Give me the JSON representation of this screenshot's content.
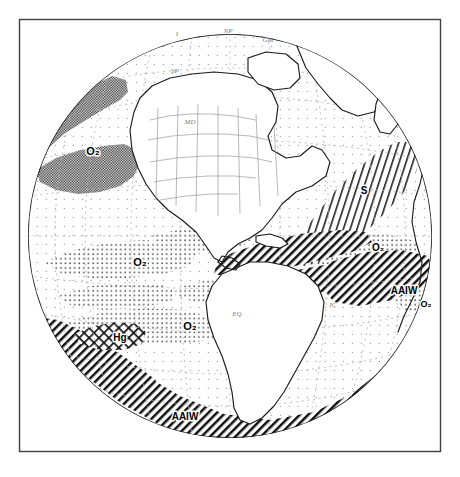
{
  "figure": {
    "type": "orthographic-globe-map",
    "title_visible": "",
    "frame": {
      "x": 19,
      "y": 19,
      "width": 422,
      "height": 433,
      "stroke": "#3a3a3a"
    },
    "globe": {
      "center_x": 230,
      "center_y": 236,
      "radius": 202,
      "stroke": "#222222"
    },
    "background_color": "#ffffff",
    "ink_color": "#000000"
  },
  "map_labels": {
    "o2_north_pacific": "O₂",
    "o2_mid_pacific": "O₂",
    "o2_east_pacific": "O₂",
    "o2_equatorial_pacific": "O₂",
    "o2_south_atlantic": "O₂",
    "o2_southeast_atlantic": "O₂",
    "aaiw_south_pacific": "AAIW",
    "aaiw_south_atlantic": "AAIW",
    "aaiw_southeast": "AAIW",
    "s_north_atlantic": "S",
    "hg_south_pacific": "Hg"
  },
  "faint_geographic_labels": [
    {
      "name": "arctic-label-i",
      "text": "I",
      "x": 177,
      "y": 36
    },
    {
      "name": "arctic-label-nf",
      "text": "NP",
      "x": 228,
      "y": 33
    },
    {
      "name": "arctic-label-gm",
      "text": "GM",
      "x": 268,
      "y": 42
    },
    {
      "name": "label-sp",
      "text": "SP",
      "x": 175,
      "y": 73
    },
    {
      "name": "label-md",
      "text": "MD",
      "x": 190,
      "y": 124
    },
    {
      "name": "label-eq",
      "text": "EQ",
      "x": 237,
      "y": 316
    },
    {
      "name": "label-ic",
      "text": "IC",
      "x": 333,
      "y": 307
    }
  ],
  "legend_regions": [
    {
      "key": "dense-checker",
      "description": "dense checkerboard stipple — high O₂ core",
      "pattern": "checker"
    },
    {
      "key": "coarse-stipple",
      "description": "coarse dot stipple — O₂ tongue",
      "pattern": "dots"
    },
    {
      "key": "fine-stipple",
      "description": "fine sparse dot stipple — background ocean",
      "pattern": "fine-dots"
    },
    {
      "key": "diagonal-hatch",
      "description": "diagonal hatching — AAIW / S water mass",
      "pattern": "hatch"
    },
    {
      "key": "cross-hatch",
      "description": "cross hatching — Hg anomaly patch",
      "pattern": "crosshatch"
    }
  ],
  "graticule": {
    "meridian_spacing_deg": 15,
    "parallel_spacing_deg": 15,
    "style": "dotted",
    "color": "#b9b9b9"
  }
}
